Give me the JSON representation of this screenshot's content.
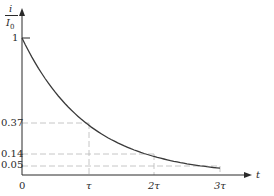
{
  "chart_data": {
    "type": "line",
    "title": "",
    "xlabel": "t",
    "ylabel_numerator": "i",
    "ylabel_denominator": "I",
    "ylabel_subscript": "0",
    "ylabel": "i/I0",
    "xlim": [
      0,
      3
    ],
    "ylim": [
      0,
      1
    ],
    "grid": false,
    "legend": null,
    "x_ticks": [
      {
        "value": 0,
        "label": "0"
      },
      {
        "value": 1,
        "label": "τ"
      },
      {
        "value": 2,
        "label": "2τ"
      },
      {
        "value": 3,
        "label": "3τ"
      }
    ],
    "y_ticks": [
      {
        "value": 1,
        "label": "1"
      },
      {
        "value": 0.37,
        "label": "0.37"
      },
      {
        "value": 0.14,
        "label": "0.14"
      },
      {
        "value": 0.05,
        "label": "0.05"
      }
    ],
    "series": [
      {
        "name": "i/I0 = e^(-t/τ)",
        "x": [
          0,
          0.25,
          0.5,
          0.75,
          1,
          1.25,
          1.5,
          1.75,
          2,
          2.25,
          2.5,
          2.75,
          3
        ],
        "y": [
          1,
          0.78,
          0.61,
          0.47,
          0.37,
          0.29,
          0.22,
          0.17,
          0.14,
          0.11,
          0.08,
          0.06,
          0.05
        ]
      }
    ],
    "reference_lines": [
      {
        "type": "dashed",
        "from": [
          0,
          0.37
        ],
        "to": [
          1,
          0.37
        ],
        "vertical_to_axis": true
      },
      {
        "type": "dashed",
        "from": [
          0,
          0.14
        ],
        "to": [
          2,
          0.14
        ],
        "vertical_to_axis": true
      },
      {
        "type": "dashed",
        "from": [
          0,
          0.05
        ],
        "to": [
          3,
          0.05
        ],
        "vertical_to_axis": true
      }
    ]
  },
  "colors": {
    "curve": "#3a3a3a",
    "axis": "#2a2a2a",
    "dash": "#b8b8b8"
  }
}
